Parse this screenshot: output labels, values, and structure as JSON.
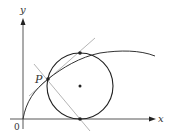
{
  "diagram": {
    "axes": {
      "x_label": "x",
      "y_label": "y",
      "origin_label": "0",
      "color": "#333333"
    },
    "point_label": "P",
    "curve": {
      "description": "increasing concave curve through origin",
      "color": "#333333"
    },
    "circle": {
      "description": "circle tangent to x-axis, passing through P",
      "color": "#222222",
      "center_marked": true
    },
    "tangent_line": {
      "color": "#aaaaaa"
    },
    "normal_line": {
      "color": "#aaaaaa"
    },
    "marked_points": [
      "P",
      "circle-top",
      "circle-center",
      "circle-bottom"
    ]
  }
}
